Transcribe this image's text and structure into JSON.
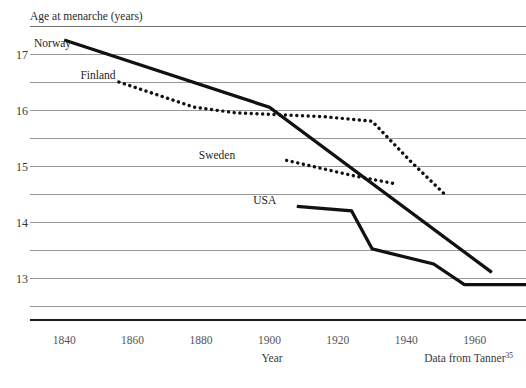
{
  "chart_data": {
    "type": "line",
    "title": "",
    "ylabel": "Age at menarche (years)",
    "xlabel": "Year",
    "source_note": "Data from Tanner",
    "source_superscript": "35",
    "xlim": [
      1830,
      1975
    ],
    "ylim": [
      12.25,
      17.5
    ],
    "xticks": [
      1840,
      1860,
      1880,
      1900,
      1920,
      1940,
      1960
    ],
    "yticks": [
      13,
      14,
      15,
      16,
      17
    ],
    "gridlines_y": [
      12.5,
      13.0,
      13.5,
      14.0,
      14.5,
      15.0,
      15.5,
      16.0,
      16.5,
      17.0,
      17.5
    ],
    "grid": true,
    "legend": "inline-labels",
    "series": [
      {
        "name": "Norway",
        "style": "solid",
        "label_x": 1842,
        "label_y": 17.2,
        "points": [
          {
            "x": 1840,
            "y": 17.25
          },
          {
            "x": 1900,
            "y": 16.05
          },
          {
            "x": 1965,
            "y": 13.1
          }
        ]
      },
      {
        "name": "Finland",
        "style": "dotted",
        "label_x": 1855,
        "label_y": 16.62,
        "points": [
          {
            "x": 1856,
            "y": 16.5
          },
          {
            "x": 1878,
            "y": 16.05
          },
          {
            "x": 1890,
            "y": 15.95
          },
          {
            "x": 1916,
            "y": 15.88
          },
          {
            "x": 1930,
            "y": 15.8
          },
          {
            "x": 1941,
            "y": 15.1
          },
          {
            "x": 1952,
            "y": 14.45
          }
        ]
      },
      {
        "name": "Sweden",
        "style": "dotted",
        "label_x": 1890,
        "label_y": 15.2,
        "points": [
          {
            "x": 1905,
            "y": 15.1
          },
          {
            "x": 1925,
            "y": 14.82
          },
          {
            "x": 1937,
            "y": 14.68
          }
        ]
      },
      {
        "name": "USA",
        "style": "solid",
        "label_x": 1902,
        "label_y": 14.4,
        "points": [
          {
            "x": 1908,
            "y": 14.28
          },
          {
            "x": 1924,
            "y": 14.2
          },
          {
            "x": 1930,
            "y": 13.52
          },
          {
            "x": 1948,
            "y": 13.25
          },
          {
            "x": 1957,
            "y": 12.88
          },
          {
            "x": 1975,
            "y": 12.88
          }
        ]
      }
    ]
  },
  "axis": {
    "y_title": "Age at menarche (years)",
    "x_title": "Year",
    "y_tick_labels": [
      "17",
      "16",
      "15",
      "14",
      "13"
    ],
    "x_tick_labels": [
      "1840",
      "1860",
      "1880",
      "1900",
      "1920",
      "1940",
      "1960"
    ]
  },
  "footer": {
    "source": "Data from Tanner",
    "source_ref": "35"
  },
  "series_labels": {
    "norway": "Norway",
    "finland": "Finland",
    "sweden": "Sweden",
    "usa": "USA"
  },
  "colors": {
    "line": "#111111",
    "grid": "#8d8d8d",
    "axis": "#1d1d1d",
    "text": "#2b2b2b",
    "background": "#ffffff"
  }
}
